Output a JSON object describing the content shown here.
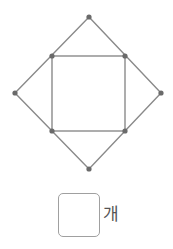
{
  "diagram": {
    "stroke_color": "#8a8a8a",
    "point_color": "#6a6a6a",
    "points": [
      {
        "name": "top",
        "x": 89,
        "y": 17
      },
      {
        "name": "inner-top-left",
        "x": 52,
        "y": 56
      },
      {
        "name": "inner-top-right",
        "x": 125,
        "y": 56
      },
      {
        "name": "left",
        "x": 15,
        "y": 93
      },
      {
        "name": "right",
        "x": 161,
        "y": 93
      },
      {
        "name": "inner-bottom-left",
        "x": 52,
        "y": 131
      },
      {
        "name": "inner-bottom-right",
        "x": 125,
        "y": 131
      },
      {
        "name": "bottom",
        "x": 89,
        "y": 169
      }
    ],
    "outer_shape": "diamond",
    "inner_shape": "square"
  },
  "answer": {
    "value": "",
    "unit": "개"
  }
}
